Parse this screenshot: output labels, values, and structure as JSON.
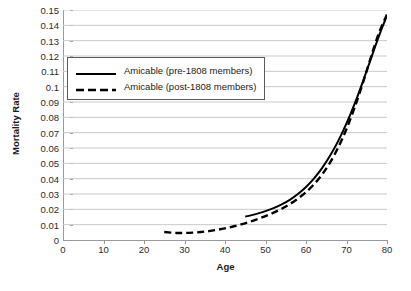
{
  "chart_data": {
    "type": "line",
    "title": "",
    "xlabel": "Age",
    "ylabel": "Mortality Rate",
    "xlim": [
      0,
      80
    ],
    "ylim": [
      0,
      0.15
    ],
    "grid": true,
    "grid_axis": "y",
    "legend_position": "upper-left-inside",
    "xticks": [
      0,
      10,
      20,
      30,
      40,
      50,
      60,
      70,
      80
    ],
    "xtick_labels": [
      "0",
      "10",
      "20",
      "30",
      "40",
      "50",
      "60",
      "70",
      "80"
    ],
    "yticks": [
      0,
      0.01,
      0.02,
      0.03,
      0.04,
      0.05,
      0.06,
      0.07,
      0.08,
      0.09,
      0.1,
      0.11,
      0.12,
      0.13,
      0.14,
      0.15
    ],
    "ytick_labels": [
      "0",
      "0.01",
      "0.02",
      "0.03",
      "0.04",
      "0.05",
      "0.06",
      "0.07",
      "0.08",
      "0.09",
      "0.1",
      "0.11",
      "0.12",
      "0.13",
      "0.14",
      "0.15"
    ],
    "series": [
      {
        "name": "Amicable (pre-1808 members)",
        "style": "solid",
        "color": "#000000",
        "x": [
          45,
          48,
          50,
          52,
          54,
          56,
          58,
          60,
          62,
          64,
          66,
          68,
          70,
          72,
          74,
          76,
          78,
          80
        ],
        "values": [
          0.0152,
          0.0172,
          0.0188,
          0.0208,
          0.0232,
          0.0262,
          0.03,
          0.0346,
          0.0402,
          0.047,
          0.0552,
          0.0648,
          0.076,
          0.0888,
          0.103,
          0.118,
          0.133,
          0.1465
        ]
      },
      {
        "name": "Amicable (post-1808 members)",
        "style": "dashed",
        "color": "#000000",
        "x": [
          25,
          28,
          30,
          32,
          34,
          36,
          38,
          40,
          42,
          44,
          46,
          48,
          50,
          52,
          54,
          56,
          58,
          60,
          62,
          64,
          66,
          68,
          70,
          72,
          74,
          76,
          78,
          80
        ],
        "values": [
          0.0052,
          0.0046,
          0.0046,
          0.0048,
          0.0052,
          0.0058,
          0.0066,
          0.0076,
          0.0088,
          0.0102,
          0.0118,
          0.0136,
          0.0156,
          0.0178,
          0.0204,
          0.0234,
          0.027,
          0.0312,
          0.0364,
          0.0428,
          0.0508,
          0.0606,
          0.0724,
          0.0864,
          0.102,
          0.119,
          0.135,
          0.147
        ]
      }
    ]
  },
  "legend": {
    "items": [
      {
        "label": "Amicable (pre-1808 members)",
        "style": "solid"
      },
      {
        "label": "Amicable (post-1808 members)",
        "style": "dashed"
      }
    ]
  }
}
